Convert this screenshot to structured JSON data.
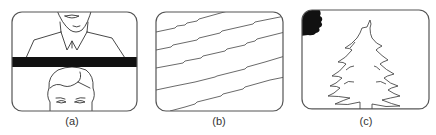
{
  "figure": {
    "panels": [
      {
        "id": "a",
        "caption": "(a)",
        "description": "TV screen showing vertical roll: bottom of one frame above black blanking bar and top of next frame below"
      },
      {
        "id": "b",
        "caption": "(b)",
        "description": "TV screen showing diagonal jagged lines (horizontal sync loss / tearing)"
      },
      {
        "id": "c",
        "caption": "(c)",
        "description": "TV screen showing outlined pine tree with dark blot in upper-left corner"
      }
    ]
  },
  "colors": {
    "stroke": "#333333",
    "fill_dark": "#111111",
    "background": "#ffffff"
  }
}
